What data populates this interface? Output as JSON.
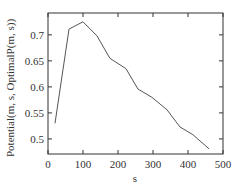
{
  "chart_data": {
    "type": "line",
    "title": "",
    "xlabel": "s",
    "ylabel": "Potential(m, s, OptimalP(m, s))",
    "xlim": [
      0,
      500
    ],
    "ylim": [
      0.471,
      0.742
    ],
    "xticks": [
      0,
      100,
      200,
      300,
      400,
      500
    ],
    "yticks": [
      0.5,
      0.55,
      0.6,
      0.65,
      0.7
    ],
    "ytick_labels": [
      "0.5",
      "0.55",
      "0.6",
      "0.65",
      "0.7"
    ],
    "xtick_labels": [
      "0",
      "100",
      "200",
      "300",
      "400",
      "500"
    ],
    "grid": false,
    "legend": null,
    "series": [
      {
        "name": "Potential",
        "color": "#555555",
        "x": [
          20,
          60,
          100,
          140,
          177,
          223,
          257,
          297,
          340,
          377,
          414,
          460
        ],
        "y": [
          0.53,
          0.711,
          0.725,
          0.698,
          0.655,
          0.635,
          0.596,
          0.58,
          0.556,
          0.523,
          0.508,
          0.481
        ]
      }
    ]
  }
}
